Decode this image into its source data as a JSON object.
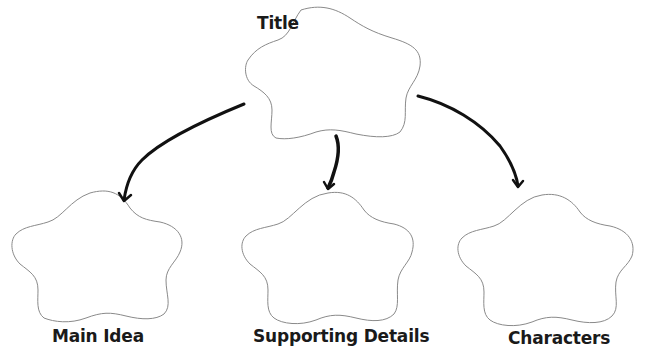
{
  "diagram": {
    "type": "graphic-organizer",
    "title_node": {
      "label": "Title"
    },
    "child_nodes": [
      {
        "label": "Main Idea"
      },
      {
        "label": "Supporting Details"
      },
      {
        "label": "Characters"
      }
    ],
    "edges": [
      {
        "from": "Title",
        "to": "Main Idea"
      },
      {
        "from": "Title",
        "to": "Supporting Details"
      },
      {
        "from": "Title",
        "to": "Characters"
      }
    ],
    "colors": {
      "background": "#ffffff",
      "shape_outline": "#8a8a8a",
      "arrow": "#111111",
      "text": "#1a1a1a"
    }
  }
}
